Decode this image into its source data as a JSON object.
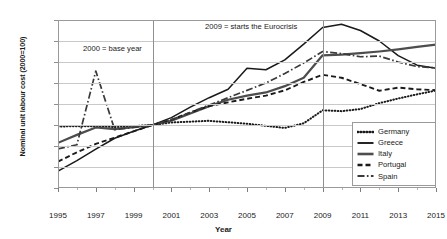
{
  "chart_data": {
    "type": "line",
    "title": "",
    "xlabel": "Year",
    "ylabel": "Nominal unit labour cost (2000=100)",
    "xlim": [
      1995,
      2015
    ],
    "ylim": [
      70,
      150
    ],
    "yticks": [
      70,
      80,
      90,
      100,
      110,
      120,
      130,
      140,
      150
    ],
    "xticks": [
      1995,
      1997,
      1999,
      2001,
      2003,
      2005,
      2007,
      2009,
      2011,
      2013,
      2015
    ],
    "grid": "horizontal",
    "legend_position": "bottom-right",
    "x": [
      1995,
      1996,
      1997,
      1998,
      1999,
      2000,
      2001,
      2002,
      2003,
      2004,
      2005,
      2006,
      2007,
      2008,
      2009,
      2010,
      2011,
      2012,
      2013,
      2014,
      2015
    ],
    "series": [
      {
        "name": "Germany",
        "style": "dotted",
        "color": "#1a1a1a",
        "values": [
          99.3,
          99.4,
          99.4,
          99.0,
          99.5,
          100.0,
          101.2,
          101.6,
          102.0,
          101.3,
          100.6,
          99.6,
          98.6,
          100.8,
          107.0,
          106.6,
          107.6,
          110.4,
          112.6,
          114.6,
          116.4
        ]
      },
      {
        "name": "Greece",
        "style": "solid-thin",
        "color": "#1a1a1a",
        "values": [
          78.1,
          83.0,
          88.5,
          93.7,
          97.0,
          100.0,
          103.5,
          108.5,
          113.0,
          117.0,
          127.0,
          126.3,
          131.0,
          138.5,
          146.4,
          148.0,
          145.0,
          140.0,
          133.0,
          128.5,
          127.0
        ]
      },
      {
        "name": "Italy",
        "style": "solid-thick",
        "color": "#4d4d4d",
        "values": [
          91.5,
          95.3,
          98.8,
          98.0,
          99.0,
          100.0,
          102.0,
          105.5,
          109.0,
          112.0,
          114.0,
          115.5,
          118.5,
          122.5,
          133.2,
          133.5,
          134.2,
          135.0,
          136.0,
          137.2,
          138.3
        ]
      },
      {
        "name": "Portugal",
        "style": "dashed",
        "color": "#1a1a1a",
        "values": [
          82.6,
          87.0,
          91.0,
          94.0,
          97.0,
          100.0,
          102.5,
          106.0,
          109.0,
          110.8,
          112.5,
          114.0,
          116.5,
          120.5,
          123.9,
          122.5,
          119.5,
          116.3,
          117.8,
          117.0,
          116.6
        ]
      },
      {
        "name": "Spain",
        "style": "dashdot",
        "color": "#3a3a3a",
        "values": [
          88.6,
          90.6,
          125.7,
          97.8,
          98.8,
          100.0,
          102.5,
          106.0,
          109.5,
          113.0,
          116.5,
          120.0,
          124.5,
          129.5,
          135.0,
          134.0,
          132.5,
          132.8,
          130.0,
          127.8,
          127.2
        ]
      }
    ],
    "annotations": [
      {
        "text": "2000 = base year",
        "x_year": 2000,
        "y_value": 136
      },
      {
        "text": "2009 = starts the Eurocrisis",
        "x_year": 2009,
        "y_value": 148
      }
    ],
    "reference_lines": [
      {
        "x_year": 2000
      },
      {
        "x_year": 2009
      }
    ]
  },
  "legend": {
    "items": [
      {
        "label": "Germany"
      },
      {
        "label": "Greece"
      },
      {
        "label": "Italy"
      },
      {
        "label": "Portugal"
      },
      {
        "label": "Spain"
      }
    ]
  }
}
